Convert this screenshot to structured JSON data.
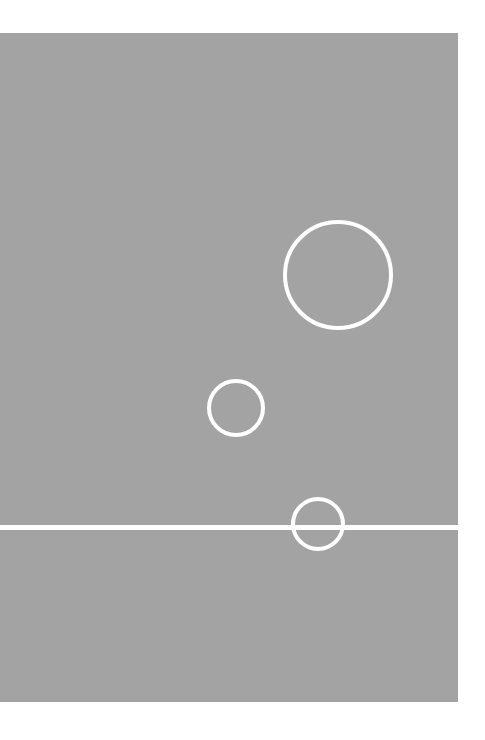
{
  "composition": {
    "title": "Abstract Geometric Composition",
    "canvas": {
      "width": 485,
      "height": 740,
      "background_color": "#ffffff"
    },
    "panel": {
      "label": "gray-panel",
      "fill_color": "#a3a3a3",
      "x": 0,
      "y": 33,
      "width": 458,
      "height": 669
    },
    "stroke_color": "#ffffff",
    "shapes": [
      {
        "name": "circle-large",
        "type": "circle",
        "center_x": 338,
        "center_y": 275,
        "radius": 55,
        "stroke_width": 4,
        "fill": "none"
      },
      {
        "name": "circle-medium",
        "type": "circle",
        "center_x": 236,
        "center_y": 408,
        "radius": 29,
        "stroke_width": 4,
        "fill": "none"
      },
      {
        "name": "circle-small",
        "type": "circle",
        "center_x": 318,
        "center_y": 524,
        "radius": 27,
        "stroke_width": 4,
        "fill": "none",
        "note": "lower portion occluded by horizon line"
      }
    ],
    "horizon_line": {
      "name": "horizon-line",
      "type": "line",
      "x": 0,
      "y": 527,
      "width": 458,
      "thickness": 5,
      "color": "#ffffff",
      "orientation": "horizontal"
    }
  }
}
